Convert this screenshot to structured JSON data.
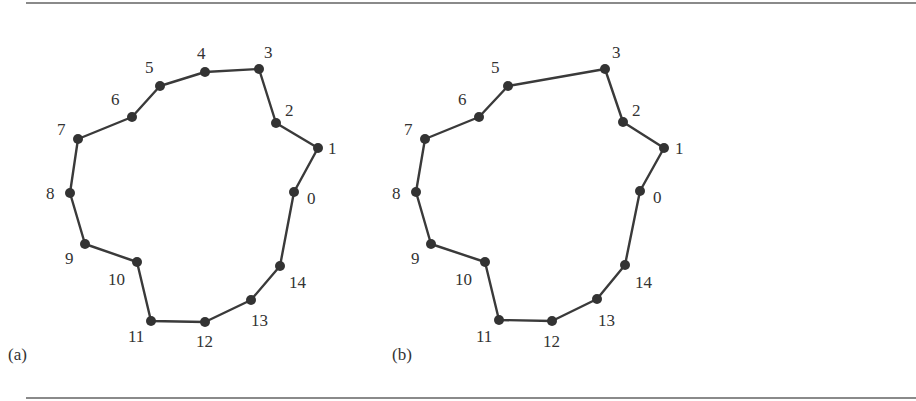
{
  "figure": {
    "panels": [
      {
        "id": "a",
        "caption": "(a)",
        "caption_pos": [
          8,
          360
        ],
        "vertices": [
          {
            "label": "0",
            "x": 294,
            "y": 192,
            "lx": 307,
            "ly": 204
          },
          {
            "label": "1",
            "x": 318,
            "y": 148,
            "lx": 328,
            "ly": 154
          },
          {
            "label": "2",
            "x": 276,
            "y": 123,
            "lx": 285,
            "ly": 116
          },
          {
            "label": "3",
            "x": 259,
            "y": 69,
            "lx": 264,
            "ly": 58
          },
          {
            "label": "4",
            "x": 205,
            "y": 72,
            "lx": 197,
            "ly": 59
          },
          {
            "label": "5",
            "x": 160,
            "y": 86,
            "lx": 145,
            "ly": 73
          },
          {
            "label": "6",
            "x": 132,
            "y": 117,
            "lx": 111,
            "ly": 105
          },
          {
            "label": "7",
            "x": 78,
            "y": 139,
            "lx": 57,
            "ly": 135
          },
          {
            "label": "8",
            "x": 70,
            "y": 193,
            "lx": 46,
            "ly": 199
          },
          {
            "label": "9",
            "x": 85,
            "y": 244,
            "lx": 65,
            "ly": 264
          },
          {
            "label": "10",
            "x": 137,
            "y": 262,
            "lx": 108,
            "ly": 285
          },
          {
            "label": "11",
            "x": 151,
            "y": 321,
            "lx": 128,
            "ly": 342
          },
          {
            "label": "12",
            "x": 205,
            "y": 322,
            "lx": 196,
            "ly": 347
          },
          {
            "label": "13",
            "x": 251,
            "y": 300,
            "lx": 251,
            "ly": 326
          },
          {
            "label": "14",
            "x": 280,
            "y": 266,
            "lx": 289,
            "ly": 288
          }
        ]
      },
      {
        "id": "b",
        "caption": "(b)",
        "caption_pos": [
          392,
          360
        ],
        "vertices": [
          {
            "label": "0",
            "x": 640,
            "y": 191,
            "lx": 653,
            "ly": 203
          },
          {
            "label": "1",
            "x": 664,
            "y": 148,
            "lx": 675,
            "ly": 154
          },
          {
            "label": "2",
            "x": 623,
            "y": 122,
            "lx": 632,
            "ly": 116
          },
          {
            "label": "3",
            "x": 605,
            "y": 69,
            "lx": 612,
            "ly": 58
          },
          {
            "label": "5",
            "x": 508,
            "y": 86,
            "lx": 491,
            "ly": 73
          },
          {
            "label": "6",
            "x": 479,
            "y": 117,
            "lx": 458,
            "ly": 105
          },
          {
            "label": "7",
            "x": 425,
            "y": 139,
            "lx": 404,
            "ly": 135
          },
          {
            "label": "8",
            "x": 416,
            "y": 192,
            "lx": 392,
            "ly": 199
          },
          {
            "label": "9",
            "x": 431,
            "y": 244,
            "lx": 411,
            "ly": 264
          },
          {
            "label": "10",
            "x": 485,
            "y": 262,
            "lx": 455,
            "ly": 285
          },
          {
            "label": "11",
            "x": 499,
            "y": 320,
            "lx": 476,
            "ly": 342
          },
          {
            "label": "12",
            "x": 552,
            "y": 321,
            "lx": 543,
            "ly": 347
          },
          {
            "label": "13",
            "x": 597,
            "y": 299,
            "lx": 598,
            "ly": 326
          },
          {
            "label": "14",
            "x": 625,
            "y": 265,
            "lx": 635,
            "ly": 288
          }
        ]
      }
    ],
    "style": {
      "edge_color": "#3a3a3a",
      "vertex_color": "#333333",
      "label_color": "#333333",
      "rule_color": "#8a8a8a",
      "vertex_radius": 5
    }
  }
}
